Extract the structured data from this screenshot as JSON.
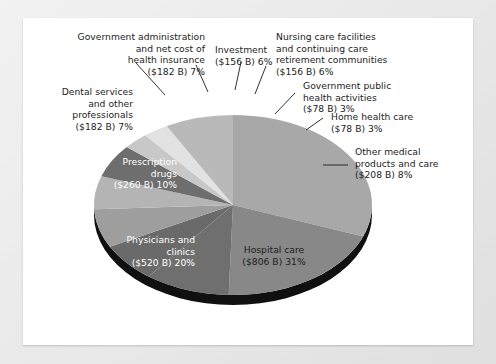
{
  "figure": {
    "background_color": "#e3e3e3",
    "panel_color": "#ffffff"
  },
  "chart_data": {
    "type": "pie",
    "title": "",
    "subtitle": "",
    "xlabel": "",
    "ylabel": "",
    "legend_position": "none",
    "grid": false,
    "units": "billions of US dollars",
    "categories": [
      "Hospital care",
      "Physicians and clinics",
      "Prescription drugs",
      "Dental services and other professionals",
      "Government administration and net cost of health insurance",
      "Investment",
      "Nursing care facilities and continuing care retirement communities",
      "Government public health activities",
      "Home health care",
      "Other medical products and care"
    ],
    "values": [
      806,
      520,
      260,
      182,
      182,
      156,
      156,
      78,
      78,
      208
    ],
    "percentages": [
      31,
      20,
      10,
      7,
      7,
      6,
      6,
      3,
      3,
      8
    ],
    "value_labels": [
      "($806 B) 31%",
      "($520 B) 20%",
      "($260 B) 10%",
      "($182 B) 7%",
      "($182 B) 7%",
      "($156 B) 6%",
      "($156 B) 6%",
      "($78 B) 3%",
      "($78 B) 3%",
      "($208 B) 8%"
    ],
    "slice_colors": [
      "#a8a8a8",
      "#888888",
      "#6f6f6f",
      "#6a6a6a",
      "#9e9e9e",
      "#b4b4b4",
      "#6e6e6e",
      "#c8c8c8",
      "#e2e2e2",
      "#b9b9b9"
    ],
    "depth_color": "#101010"
  },
  "slices": [
    {
      "name": "hospital-care",
      "label": "Hospital care",
      "value_label": "($806 B) 31%",
      "text": "Hospital care\n($806 B) 31%",
      "color": "#a8a8a8",
      "label_style": "dark",
      "label_placement": "inside"
    },
    {
      "name": "physicians-and-clinics",
      "label": "Physicians and clinics",
      "value_label": "($520 B) 20%",
      "text": "Physicians and\nclinics\n($520 B) 20%",
      "color": "#888888",
      "label_style": "light",
      "label_placement": "inside"
    },
    {
      "name": "prescription-drugs",
      "label": "Prescription drugs",
      "value_label": "($260 B) 10%",
      "text": "Prescription\ndrugs\n($260 B) 10%",
      "color": "#6f6f6f",
      "label_style": "light",
      "label_placement": "inside"
    },
    {
      "name": "dental-services-and-other-professionals",
      "label": "Dental services and other professionals",
      "value_label": "($182 B) 7%",
      "text": "Dental services\nand other\nprofessionals\n($182 B) 7%",
      "color": "#6a6a6a",
      "label_style": "dark",
      "label_placement": "callout"
    },
    {
      "name": "government-administration",
      "label": "Government administration and net cost of health insurance",
      "value_label": "($182 B) 7%",
      "text": "Government administration\nand net cost of\nhealth insurance\n($182 B) 7%",
      "color": "#9e9e9e",
      "label_style": "dark",
      "label_placement": "callout"
    },
    {
      "name": "investment",
      "label": "Investment",
      "value_label": "($156 B) 6%",
      "text": "Investment\n($156 B) 6%",
      "color": "#b4b4b4",
      "label_style": "dark",
      "label_placement": "callout"
    },
    {
      "name": "nursing-care-facilities",
      "label": "Nursing care facilities and continuing care retirement communities",
      "value_label": "($156 B) 6%",
      "text": "Nursing care facilities\nand continuing care\nretirement communities\n($156 B) 6%",
      "color": "#6e6e6e",
      "label_style": "dark",
      "label_placement": "callout"
    },
    {
      "name": "government-public-health-activities",
      "label": "Government public health activities",
      "value_label": "($78 B) 3%",
      "text": "Government public\nhealth activities\n($78 B) 3%",
      "color": "#c8c8c8",
      "label_style": "dark",
      "label_placement": "callout"
    },
    {
      "name": "home-health-care",
      "label": "Home health care",
      "value_label": "($78 B) 3%",
      "text": "Home health care\n($78 B) 3%",
      "color": "#e2e2e2",
      "label_style": "dark",
      "label_placement": "callout"
    },
    {
      "name": "other-medical-products-and-care",
      "label": "Other medical products and care",
      "value_label": "($208 B) 8%",
      "text": "Other medical\nproducts and care\n($208 B) 8%",
      "color": "#b9b9b9",
      "label_style": "dark",
      "label_placement": "callout"
    }
  ]
}
